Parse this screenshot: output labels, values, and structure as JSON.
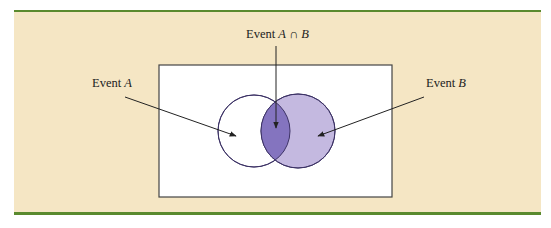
{
  "diagram": {
    "type": "venn",
    "labels": {
      "intersection": {
        "prefix": "Event ",
        "a": "A",
        "op": " ∩ ",
        "b": "B"
      },
      "event_a": {
        "prefix": "Event ",
        "var": "A"
      },
      "event_b": {
        "prefix": "Event ",
        "var": "B"
      }
    },
    "colors": {
      "panel_background": "#f5e6c4",
      "rule": "#5a8a2e",
      "circle_a_fill": "#ffffff",
      "circle_b_fill": "#c4b9e0",
      "intersection_fill": "#8474bf",
      "outline": "#3d3366"
    },
    "sets": [
      {
        "name": "A",
        "cx": 254,
        "cy": 131,
        "r": 36
      },
      {
        "name": "B",
        "cx": 298,
        "cy": 131,
        "r": 37
      }
    ],
    "sample_space": {
      "x": 159,
      "y": 65,
      "width": 233,
      "height": 132
    }
  }
}
